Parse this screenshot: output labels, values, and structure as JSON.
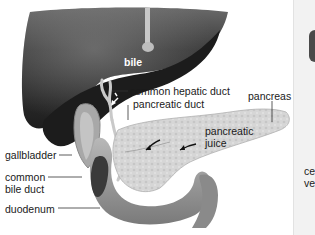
{
  "figure": {
    "labels": {
      "bile": "bile",
      "common_hepatic_duct": "common hepatic duct",
      "pancreatic_duct": "pancreatic duct",
      "pancreas": "pancreas",
      "pancreatic_juice_line1": "pancreatic",
      "pancreatic_juice_line2": "juice",
      "gallbladder": "gallbladder",
      "common_bile_duct_line1": "common",
      "common_bile_duct_line2": "bile duct",
      "duodenum": "duodenum"
    },
    "side_panel": {
      "text_line1": "ce",
      "text_line2": "ve"
    },
    "colors": {
      "liver": "#2e2e2e",
      "pancreas": "#d4d4d4",
      "duodenum": "#9a9a9a",
      "background": "#ffffff",
      "side_panel": "#f2f2f2"
    }
  }
}
